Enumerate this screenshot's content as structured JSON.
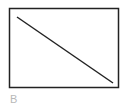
{
  "figure": {
    "label": "B",
    "frame": {
      "x": 9,
      "y": 8,
      "width": 110,
      "height": 80,
      "stroke": "#222222",
      "stroke_width": 1.5
    },
    "diagonal": {
      "x1": 17,
      "y1": 17,
      "x2": 113,
      "y2": 83,
      "stroke": "#222222",
      "stroke_width": 1.5
    }
  }
}
